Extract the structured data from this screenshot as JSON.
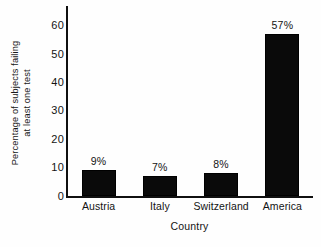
{
  "chart_data": {
    "type": "bar",
    "title": "",
    "xlabel": "Country",
    "ylabel": "Percentage of subjects failing at least one test",
    "ylabel_lines": [
      "Percentage of subjects failing",
      "at least one test"
    ],
    "categories": [
      "Austria",
      "Italy",
      "Switzerland",
      "America"
    ],
    "values": [
      9,
      7,
      8,
      57
    ],
    "data_labels": [
      "9%",
      "7%",
      "8%",
      "57%"
    ],
    "ylim": [
      0,
      67
    ],
    "yticks": [
      0,
      10,
      20,
      30,
      40,
      50,
      60
    ],
    "ytick_labels": [
      "0",
      "10",
      "20",
      "30",
      "40",
      "50",
      "60"
    ],
    "grid": false,
    "legend": false,
    "bar_color": "#0a0a0a",
    "axis_color": "#101010",
    "background_color": "#fefefe"
  }
}
